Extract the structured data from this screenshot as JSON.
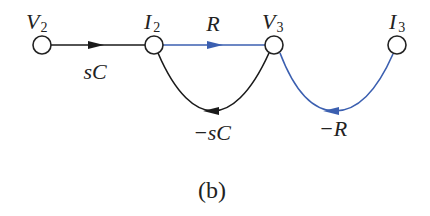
{
  "diagram": {
    "type": "signal-flow-graph",
    "caption": "(b)",
    "colors": {
      "black_branch": "#1a1a1a",
      "blue_branch": "#3b5fb0",
      "node_fill": "#ffffff",
      "node_stroke": "#222222"
    },
    "nodes": [
      {
        "id": "V2",
        "main": "V",
        "sub": "2"
      },
      {
        "id": "I2",
        "main": "I",
        "sub": "2"
      },
      {
        "id": "V3",
        "main": "V",
        "sub": "3"
      },
      {
        "id": "I3",
        "main": "I",
        "sub": "3"
      }
    ],
    "edges": [
      {
        "from": "V2",
        "to": "I2",
        "gain": "sC",
        "color": "black"
      },
      {
        "from": "I2",
        "to": "V3",
        "gain": "R",
        "color": "blue"
      },
      {
        "from": "V3",
        "to": "I2",
        "gain": "−sC",
        "color": "black"
      },
      {
        "from": "I3",
        "to": "V3",
        "gain": "−R",
        "color": "blue"
      }
    ]
  }
}
